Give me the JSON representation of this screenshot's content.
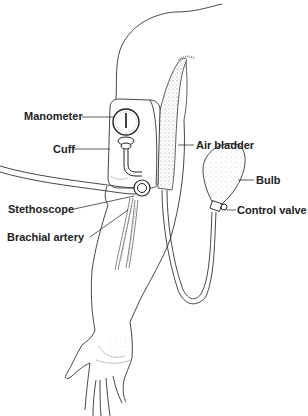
{
  "diagram": {
    "background": "#ffffff",
    "line_color": "#333333",
    "labels": [
      {
        "id": "manometer",
        "text": "Manometer",
        "x": 24,
        "y": 110
      },
      {
        "id": "cuff",
        "text": "Cuff",
        "x": 53,
        "y": 143
      },
      {
        "id": "air-bladder",
        "text": "Air bladder",
        "x": 196,
        "y": 141
      },
      {
        "id": "bulb",
        "text": "Bulb",
        "x": 256,
        "y": 175
      },
      {
        "id": "control-valve",
        "text": "Control valve",
        "x": 237,
        "y": 205
      },
      {
        "id": "stethoscope",
        "text": "Stethoscope",
        "x": 8,
        "y": 205
      },
      {
        "id": "brachial-artery",
        "text": "Brachial artery",
        "x": 7,
        "y": 233
      }
    ]
  }
}
